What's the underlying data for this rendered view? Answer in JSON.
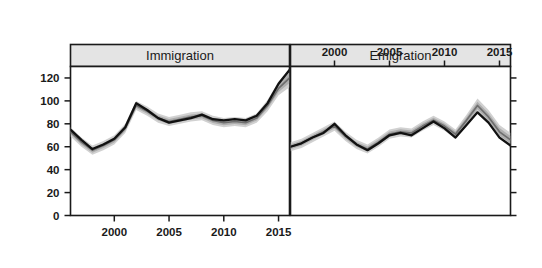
{
  "chart_data": {
    "type": "line",
    "title": "",
    "xlabel": "",
    "ylabel": "",
    "xlim": [
      1996,
      2016
    ],
    "ylim": [
      0,
      130
    ],
    "grid": false,
    "legend": "none",
    "y_ticks": [
      0,
      20,
      40,
      60,
      80,
      100,
      120
    ],
    "y_tick_labels": [
      "0",
      "20",
      "40",
      "60",
      "80",
      "100",
      "120"
    ],
    "x_ticks": [
      2000,
      2005,
      2010,
      2015
    ],
    "x_tick_labels": [
      "2000",
      "2005",
      "2010",
      "2015"
    ],
    "panels": [
      {
        "label": "Immigration",
        "axis_position": "bottom",
        "x": [
          1996,
          1997,
          1998,
          1999,
          2000,
          2001,
          2002,
          2003,
          2004,
          2005,
          2006,
          2007,
          2008,
          2009,
          2010,
          2011,
          2012,
          2013,
          2014,
          2015,
          2016
        ],
        "series": [
          {
            "name": "observed",
            "color": "#111111",
            "values": [
              75,
              66,
              58,
              62,
              67,
              77,
              98,
              92,
              85,
              81,
              83,
              85,
              88,
              84,
              83,
              84,
              83,
              87,
              98,
              115,
              127
            ]
          },
          {
            "name": "estimated",
            "color": "#6e6e6e",
            "values": [
              73,
              64,
              57,
              61,
              66,
              76,
              96,
              91,
              85,
              82,
              84,
              86,
              87,
              83,
              81,
              82,
              81,
              85,
              96,
              111,
              120
            ],
            "ci_lower": [
              69,
              60,
              53,
              57,
              62,
              72,
              92,
              87,
              81,
              78,
              80,
              82,
              83,
              79,
              77,
              78,
              77,
              81,
              91,
              105,
              112
            ],
            "ci_upper": [
              77,
              68,
              61,
              65,
              70,
              80,
              100,
              95,
              89,
              86,
              88,
              90,
              91,
              87,
              85,
              86,
              85,
              89,
              101,
              117,
              128
            ]
          }
        ]
      },
      {
        "label": "Emigration",
        "axis_position": "top",
        "x": [
          1996,
          1997,
          1998,
          1999,
          2000,
          2001,
          2002,
          2003,
          2004,
          2005,
          2006,
          2007,
          2008,
          2009,
          2010,
          2011,
          2012,
          2013,
          2014,
          2015,
          2016
        ],
        "series": [
          {
            "name": "observed",
            "color": "#111111",
            "values": [
              60,
              63,
              68,
              72,
              80,
              70,
              62,
              57,
              63,
              70,
              72,
              70,
              76,
              82,
              76,
              68,
              79,
              90,
              81,
              68,
              61
            ]
          },
          {
            "name": "estimated",
            "color": "#6e6e6e",
            "values": [
              60,
              63,
              68,
              73,
              78,
              69,
              62,
              58,
              64,
              71,
              73,
              72,
              78,
              83,
              78,
              71,
              83,
              96,
              86,
              73,
              66
            ],
            "ci_lower": [
              56,
              59,
              64,
              69,
              74,
              65,
              58,
              54,
              60,
              67,
              69,
              68,
              74,
              79,
              74,
              67,
              78,
              90,
              80,
              67,
              60
            ],
            "ci_upper": [
              64,
              67,
              72,
              77,
              82,
              73,
              66,
              62,
              68,
              75,
              77,
              76,
              82,
              87,
              82,
              75,
              88,
              102,
              92,
              79,
              72
            ]
          }
        ]
      }
    ]
  }
}
